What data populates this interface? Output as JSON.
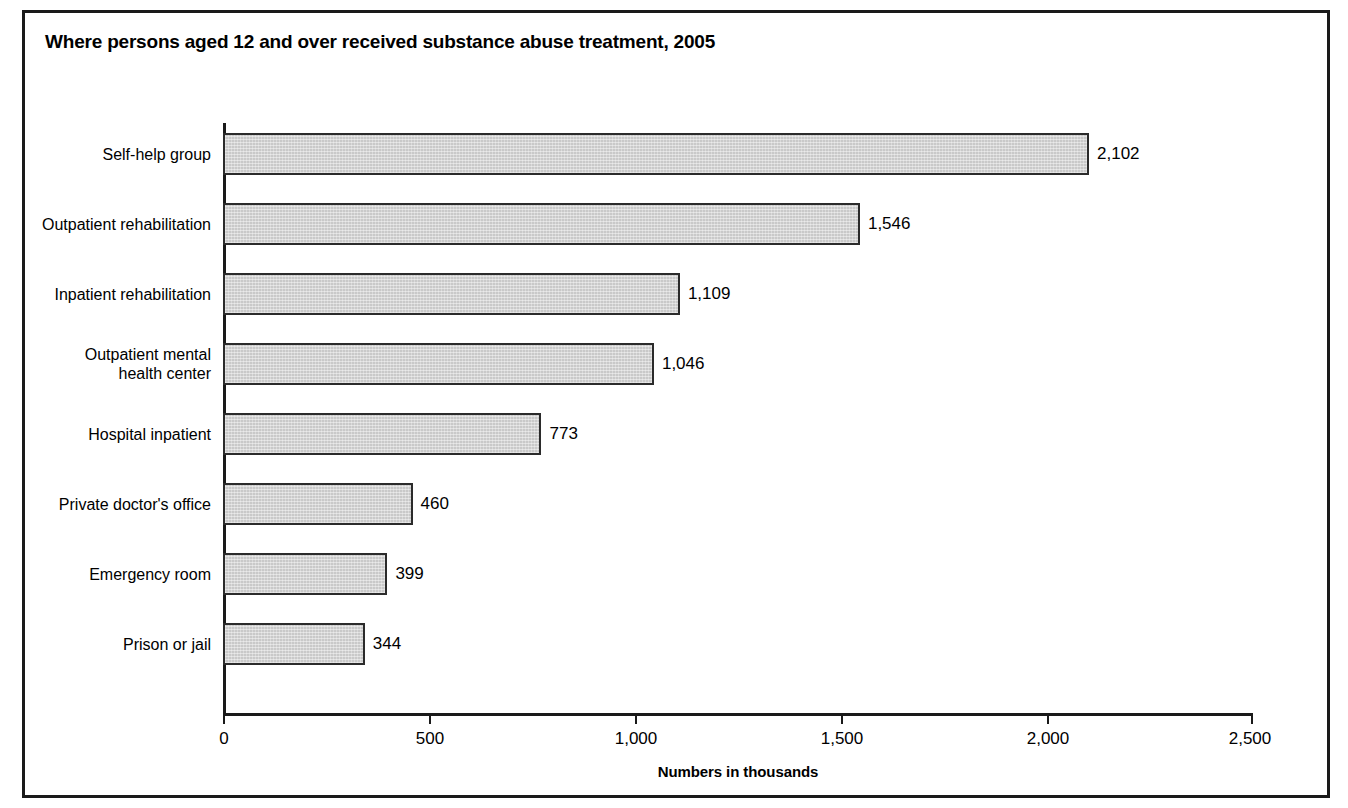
{
  "chart_data": {
    "type": "bar",
    "orientation": "horizontal",
    "title": "Where persons aged 12 and over received substance abuse treatment, 2005",
    "xlabel": "Numbers in thousands",
    "ylabel": "",
    "xlim": [
      0,
      2500
    ],
    "xticks": [
      0,
      500,
      1000,
      1500,
      2000,
      2500
    ],
    "xtick_labels": [
      "0",
      "500",
      "1,000",
      "1,500",
      "2,000",
      "2,500"
    ],
    "grid": false,
    "legend": "none",
    "categories": [
      "Self-help group",
      "Outpatient rehabilitation",
      "Inpatient rehabilitation",
      "Outpatient mental\nhealth center",
      "Hospital inpatient",
      "Private doctor's office",
      "Emergency room",
      "Prison or jail"
    ],
    "values": [
      2102,
      1546,
      1109,
      1046,
      773,
      460,
      399,
      344
    ],
    "value_labels": [
      "2,102",
      "1,546",
      "1,109",
      "1,046",
      "773",
      "460",
      "399",
      "344"
    ],
    "bar_color": "#c9c9c9",
    "bar_edge_color": "#2b2b2b",
    "axis_color": "#1a1a1a",
    "frame_color": "#1a1a1a"
  }
}
